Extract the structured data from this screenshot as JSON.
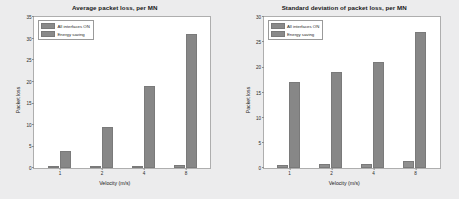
{
  "figure": {
    "background_color": "#ececed",
    "panel_color": "#ffffff",
    "bar_color": "#8a8a8a"
  },
  "panels": [
    {
      "name": "average-packet-loss",
      "chart_data": {
        "type": "bar",
        "title": "Average packet loss, per MN",
        "xlabel": "Velocity (m/s)",
        "ylabel": "Packet loss",
        "categories": [
          "1",
          "2",
          "4",
          "8"
        ],
        "series": [
          {
            "name": "All interfaces ON",
            "values": [
              0.25,
              0.3,
              0.3,
              0.8
            ]
          },
          {
            "name": "Energy saving",
            "values": [
              4,
              9.5,
              19,
              31
            ]
          }
        ],
        "ylim": [
          0,
          35
        ],
        "yticks": [
          0,
          5,
          10,
          15,
          20,
          25,
          30,
          35
        ],
        "ytick_labels": [
          "0",
          "5",
          "10",
          "15",
          "20",
          "25",
          "30",
          "35"
        ],
        "grid": false,
        "legend_position": "upper left"
      }
    },
    {
      "name": "standard-deviation-packet-loss",
      "chart_data": {
        "type": "bar",
        "title": "Standard deviation of packet loss, per MN",
        "xlabel": "Velocity (m/s)",
        "ylabel": "Packet loss",
        "categories": [
          "1",
          "2",
          "4",
          "8"
        ],
        "series": [
          {
            "name": "All interfaces ON",
            "values": [
              0.6,
              0.7,
              0.7,
              1.3
            ]
          },
          {
            "name": "Energy saving",
            "values": [
              17,
              19,
              21,
              27
            ]
          }
        ],
        "ylim": [
          0,
          30
        ],
        "yticks": [
          0,
          5,
          10,
          15,
          20,
          25,
          30
        ],
        "ytick_labels": [
          "0",
          "5",
          "10",
          "15",
          "20",
          "25",
          "30"
        ],
        "grid": false,
        "legend_position": "upper left"
      }
    }
  ]
}
